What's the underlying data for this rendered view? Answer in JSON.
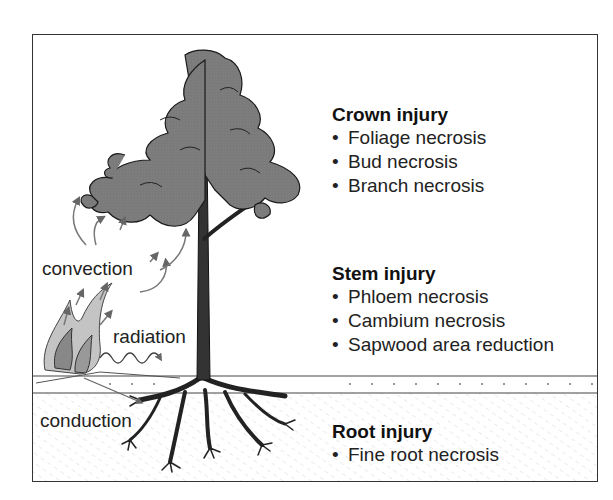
{
  "diagram": {
    "heat_transfer_labels": {
      "convection": "convection",
      "radiation": "radiation",
      "conduction": "conduction"
    },
    "sections": [
      {
        "title": "Crown injury",
        "items": [
          "Foliage necrosis",
          "Bud necrosis",
          "Branch necrosis"
        ]
      },
      {
        "title": "Stem injury",
        "items": [
          "Phloem necrosis",
          "Cambium necrosis",
          "Sapwood area reduction"
        ]
      },
      {
        "title": "Root injury",
        "items": [
          "Fine root necrosis"
        ]
      }
    ],
    "bullet": "•",
    "colors": {
      "foliage": "#777777",
      "outline": "#1a1a1a",
      "arrow": "#666666",
      "flame_light": "#bbbbbb",
      "flame_dark": "#888888",
      "soil_hatch": "#dddddd"
    }
  }
}
